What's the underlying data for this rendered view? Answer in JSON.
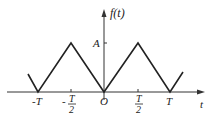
{
  "diagram": {
    "y_axis_label": "f(t)",
    "x_axis_label": "t",
    "amplitude_label": "A",
    "origin_label": "O",
    "x_ticks": [
      {
        "label": "-T",
        "frac": false
      },
      {
        "label": "T",
        "denominator": "2",
        "sign": "-",
        "frac": true
      },
      {
        "label": "T",
        "denominator": "2",
        "sign": "",
        "frac": true
      },
      {
        "label": "T",
        "frac": false
      }
    ],
    "line_color": "#222222"
  }
}
